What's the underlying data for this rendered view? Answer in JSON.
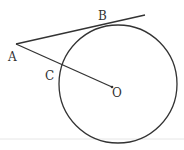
{
  "diagram": {
    "points": {
      "A": "A",
      "B": "B",
      "C": "C",
      "O": "O"
    },
    "stroke_color": "#333333"
  }
}
